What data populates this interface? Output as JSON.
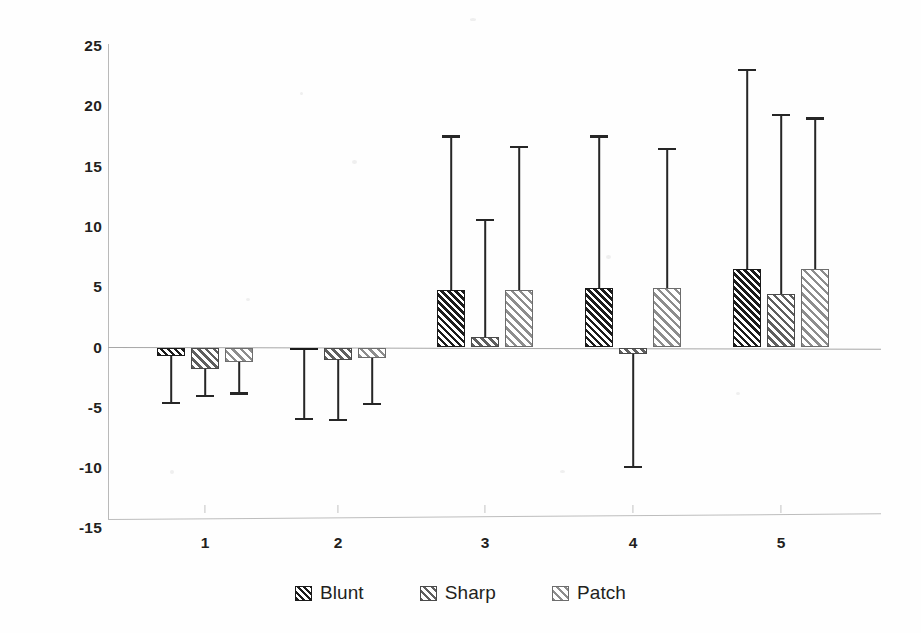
{
  "chart_data": {
    "type": "bar",
    "title": "",
    "xlabel": "",
    "ylabel": "",
    "categories": [
      "1",
      "2",
      "3",
      "4",
      "5"
    ],
    "ylim": [
      -15,
      25
    ],
    "yticks": [
      25,
      20,
      15,
      10,
      5,
      0,
      -5,
      -10,
      -15
    ],
    "grid": false,
    "legend_position": "bottom",
    "error_bars": true,
    "series": [
      {
        "name": "Blunt",
        "values": [
          -0.7,
          -0.2,
          4.8,
          4.9,
          6.5
        ],
        "err_high": [
          -0.7,
          -0.2,
          17.5,
          17.5,
          23.0
        ],
        "err_low": [
          -4.6,
          -5.9,
          4.8,
          4.9,
          6.5
        ]
      },
      {
        "name": "Sharp",
        "values": [
          -1.8,
          -1.0,
          0.9,
          -0.5,
          4.4
        ],
        "err_high": [
          -1.8,
          -1.0,
          10.6,
          -0.5,
          19.3
        ],
        "err_low": [
          -4.0,
          -6.0,
          0.9,
          -9.9,
          4.4
        ]
      },
      {
        "name": "Patch",
        "values": [
          -1.2,
          -0.9,
          4.8,
          4.9,
          6.5
        ],
        "err_high": [
          -1.2,
          -0.9,
          16.6,
          16.5,
          19.0
        ],
        "err_low": [
          -3.8,
          -4.7,
          4.8,
          4.9,
          6.5
        ]
      }
    ]
  },
  "legend": {
    "items": [
      {
        "label": "Blunt",
        "key": "blunt"
      },
      {
        "label": "Sharp",
        "key": "sharp"
      },
      {
        "label": "Patch",
        "key": "patch"
      }
    ]
  },
  "axis": {
    "y_tick_labels": [
      "25",
      "20",
      "15",
      "10",
      "5",
      "0",
      "-5",
      "-10",
      "-15"
    ],
    "x_tick_labels": [
      "1",
      "2",
      "3",
      "4",
      "5"
    ]
  }
}
